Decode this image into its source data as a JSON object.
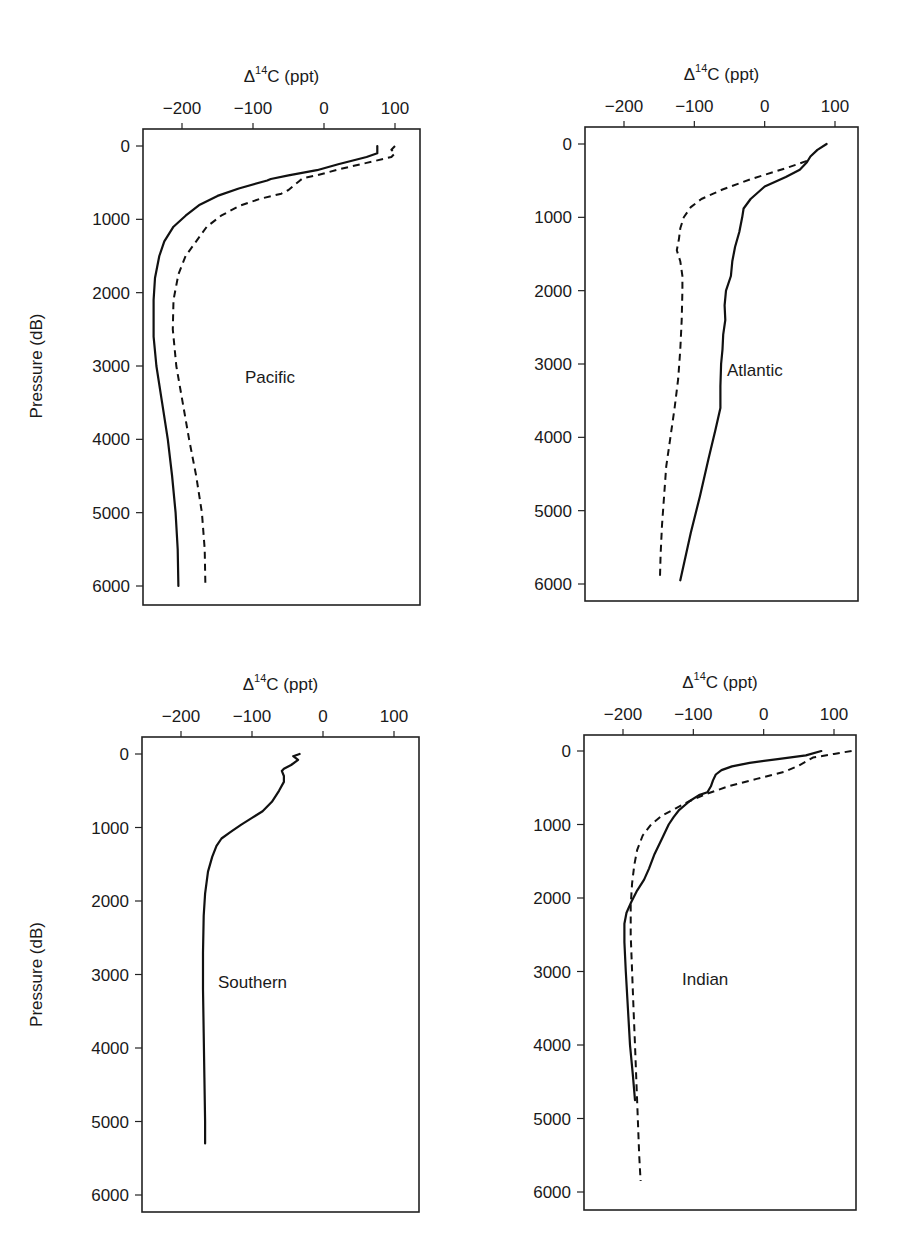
{
  "figure": {
    "xlabel": "Δ14C (ppt)",
    "xlabel_base": "Δ",
    "xlabel_sup": "14",
    "xlabel_rest": "C (ppt)",
    "ylabel": "Pressure (dB)"
  },
  "chart_data": [
    {
      "type": "line",
      "title": "Pacific",
      "xlabel": "Δ14C (ppt)",
      "ylabel": "Pressure (dB)",
      "xlim": [
        -255,
        135
      ],
      "ylim": [
        6200,
        -230
      ],
      "x_ticks": [
        -200,
        -100,
        0,
        100
      ],
      "y_ticks": [
        0,
        1000,
        2000,
        3000,
        4000,
        5000,
        6000
      ],
      "y_inverted": true,
      "grid": false,
      "series": [
        {
          "name": "solid",
          "style": "solid",
          "points": [
            [
              75,
              0
            ],
            [
              75,
              100
            ],
            [
              60,
              150
            ],
            [
              20,
              250
            ],
            [
              -10,
              330
            ],
            [
              -50,
              400
            ],
            [
              -75,
              450
            ],
            [
              -80,
              470
            ],
            [
              -120,
              580
            ],
            [
              -150,
              680
            ],
            [
              -175,
              800
            ],
            [
              -195,
              950
            ],
            [
              -212,
              1100
            ],
            [
              -225,
              1300
            ],
            [
              -232,
              1500
            ],
            [
              -238,
              1800
            ],
            [
              -240,
              2100
            ],
            [
              -240,
              2600
            ],
            [
              -236,
              3000
            ],
            [
              -228,
              3500
            ],
            [
              -220,
              4000
            ],
            [
              -214,
              4500
            ],
            [
              -209,
              5000
            ],
            [
              -206,
              5500
            ],
            [
              -205,
              6000
            ]
          ]
        },
        {
          "name": "dashed",
          "style": "dashed",
          "points": [
            [
              100,
              0
            ],
            [
              95,
              50
            ],
            [
              100,
              100
            ],
            [
              95,
              150
            ],
            [
              60,
              230
            ],
            [
              20,
              320
            ],
            [
              -10,
              400
            ],
            [
              -30,
              440
            ],
            [
              -35,
              480
            ],
            [
              -50,
              600
            ],
            [
              -60,
              650
            ],
            [
              -90,
              720
            ],
            [
              -120,
              820
            ],
            [
              -145,
              950
            ],
            [
              -165,
              1100
            ],
            [
              -180,
              1300
            ],
            [
              -195,
              1500
            ],
            [
              -205,
              1750
            ],
            [
              -212,
              2100
            ],
            [
              -213,
              2500
            ],
            [
              -208,
              3000
            ],
            [
              -199,
              3500
            ],
            [
              -190,
              4000
            ],
            [
              -180,
              4500
            ],
            [
              -172,
              5000
            ],
            [
              -168,
              5500
            ],
            [
              -167,
              6000
            ]
          ]
        }
      ]
    },
    {
      "type": "line",
      "title": "Atlantic",
      "xlabel": "Δ14C (ppt)",
      "ylabel": "Pressure (dB)",
      "xlim": [
        -255,
        130
      ],
      "ylim": [
        6200,
        -230
      ],
      "x_ticks": [
        -200,
        -100,
        0,
        100
      ],
      "y_ticks": [
        0,
        1000,
        2000,
        3000,
        4000,
        5000,
        6000
      ],
      "y_inverted": true,
      "grid": false,
      "series": [
        {
          "name": "solid",
          "style": "solid",
          "points": [
            [
              88,
              0
            ],
            [
              75,
              80
            ],
            [
              65,
              170
            ],
            [
              60,
              250
            ],
            [
              50,
              350
            ],
            [
              30,
              450
            ],
            [
              0,
              580
            ],
            [
              -20,
              750
            ],
            [
              -30,
              880
            ],
            [
              -32,
              1000
            ],
            [
              -36,
              1200
            ],
            [
              -42,
              1400
            ],
            [
              -46,
              1600
            ],
            [
              -48,
              1800
            ],
            [
              -55,
              2000
            ],
            [
              -57,
              2200
            ],
            [
              -56,
              2400
            ],
            [
              -59,
              2600
            ],
            [
              -60,
              2800
            ],
            [
              -62,
              3000
            ],
            [
              -63,
              3300
            ],
            [
              -63,
              3600
            ],
            [
              -70,
              3900
            ],
            [
              -80,
              4300
            ],
            [
              -92,
              4800
            ],
            [
              -105,
              5300
            ],
            [
              -120,
              5950
            ]
          ]
        },
        {
          "name": "dashed",
          "style": "dashed",
          "points": [
            [
              60,
              230
            ],
            [
              30,
              330
            ],
            [
              -20,
              480
            ],
            [
              -60,
              620
            ],
            [
              -90,
              750
            ],
            [
              -105,
              860
            ],
            [
              -115,
              1000
            ],
            [
              -120,
              1150
            ],
            [
              -122,
              1300
            ],
            [
              -125,
              1450
            ],
            [
              -120,
              1600
            ],
            [
              -117,
              1800
            ],
            [
              -117,
              2000
            ],
            [
              -118,
              2400
            ],
            [
              -120,
              2800
            ],
            [
              -123,
              3200
            ],
            [
              -128,
              3600
            ],
            [
              -134,
              4000
            ],
            [
              -140,
              4400
            ],
            [
              -143,
              4800
            ],
            [
              -146,
              5200
            ],
            [
              -148,
              5600
            ],
            [
              -149,
              5950
            ]
          ]
        }
      ]
    },
    {
      "type": "line",
      "title": "Southern",
      "xlabel": "Δ14C (ppt)",
      "ylabel": "Pressure (dB)",
      "xlim": [
        -255,
        135
      ],
      "ylim": [
        6200,
        -230
      ],
      "x_ticks": [
        -200,
        -100,
        0,
        100
      ],
      "y_ticks": [
        0,
        1000,
        2000,
        3000,
        4000,
        5000,
        6000
      ],
      "y_inverted": true,
      "grid": false,
      "series": [
        {
          "name": "solid",
          "style": "solid",
          "points": [
            [
              -33,
              0
            ],
            [
              -42,
              30
            ],
            [
              -35,
              80
            ],
            [
              -45,
              150
            ],
            [
              -55,
              200
            ],
            [
              -58,
              230
            ],
            [
              -55,
              300
            ],
            [
              -55,
              380
            ],
            [
              -62,
              500
            ],
            [
              -72,
              650
            ],
            [
              -85,
              780
            ],
            [
              -100,
              870
            ],
            [
              -115,
              960
            ],
            [
              -130,
              1060
            ],
            [
              -143,
              1150
            ],
            [
              -150,
              1250
            ],
            [
              -156,
              1400
            ],
            [
              -162,
              1600
            ],
            [
              -166,
              1900
            ],
            [
              -168,
              2200
            ],
            [
              -169,
              2700
            ],
            [
              -169,
              3200
            ],
            [
              -168,
              3800
            ],
            [
              -167,
              4400
            ],
            [
              -166,
              5000
            ],
            [
              -166,
              5300
            ]
          ]
        }
      ]
    },
    {
      "type": "line",
      "title": "Indian",
      "xlabel": "Δ14C (ppt)",
      "ylabel": "Pressure (dB)",
      "xlim": [
        -255,
        130
      ],
      "ylim": [
        6200,
        -230
      ],
      "x_ticks": [
        -200,
        -100,
        0,
        100
      ],
      "y_ticks": [
        0,
        1000,
        2000,
        3000,
        4000,
        5000,
        6000
      ],
      "y_inverted": true,
      "grid": false,
      "series": [
        {
          "name": "solid",
          "style": "solid",
          "points": [
            [
              82,
              0
            ],
            [
              60,
              60
            ],
            [
              20,
              110
            ],
            [
              -20,
              160
            ],
            [
              -45,
              210
            ],
            [
              -60,
              260
            ],
            [
              -68,
              320
            ],
            [
              -72,
              400
            ],
            [
              -75,
              480
            ],
            [
              -80,
              560
            ],
            [
              -92,
              600
            ],
            [
              -105,
              680
            ],
            [
              -120,
              800
            ],
            [
              -128,
              900
            ],
            [
              -135,
              1000
            ],
            [
              -145,
              1200
            ],
            [
              -155,
              1400
            ],
            [
              -163,
              1600
            ],
            [
              -170,
              1750
            ],
            [
              -180,
              1900
            ],
            [
              -188,
              2050
            ],
            [
              -195,
              2200
            ],
            [
              -198,
              2350
            ],
            [
              -198,
              2600
            ],
            [
              -196,
              3000
            ],
            [
              -193,
              3500
            ],
            [
              -190,
              4000
            ],
            [
              -186,
              4400
            ],
            [
              -183,
              4750
            ]
          ]
        },
        {
          "name": "dashed",
          "style": "dashed",
          "points": [
            [
              125,
              0
            ],
            [
              100,
              40
            ],
            [
              70,
              90
            ],
            [
              50,
              200
            ],
            [
              30,
              280
            ],
            [
              -10,
              380
            ],
            [
              -50,
              480
            ],
            [
              -80,
              580
            ],
            [
              -105,
              680
            ],
            [
              -125,
              780
            ],
            [
              -145,
              880
            ],
            [
              -160,
              1000
            ],
            [
              -172,
              1150
            ],
            [
              -180,
              1350
            ],
            [
              -184,
              1550
            ],
            [
              -187,
              1800
            ],
            [
              -189,
              2100
            ],
            [
              -189,
              2500
            ],
            [
              -187,
              3000
            ],
            [
              -185,
              3500
            ],
            [
              -183,
              4000
            ],
            [
              -181,
              4500
            ],
            [
              -179,
              5000
            ],
            [
              -177,
              5500
            ],
            [
              -175,
              5850
            ]
          ]
        }
      ]
    }
  ],
  "panels": [
    {
      "label": "Pacific",
      "box": [
        143,
        129,
        420,
        605
      ],
      "x_px": [
        182,
        395
      ],
      "y_px": [
        146,
        586
      ],
      "label_pos": [
        245,
        383
      ],
      "show_ylabel": true
    },
    {
      "label": "Atlantic",
      "box": [
        585,
        127,
        858,
        601
      ],
      "x_px": [
        624,
        835
      ],
      "y_px": [
        144,
        584
      ],
      "label_pos": [
        727,
        376
      ],
      "show_ylabel": false
    },
    {
      "label": "Southern",
      "box": [
        142,
        737,
        419,
        1212
      ],
      "x_px": [
        181,
        394
      ],
      "y_px": [
        754,
        1195
      ],
      "label_pos": [
        218,
        988
      ],
      "show_ylabel": true
    },
    {
      "label": "Indian",
      "box": [
        584,
        735,
        856,
        1210
      ],
      "x_px": [
        623,
        834
      ],
      "y_px": [
        751,
        1192
      ],
      "label_pos": [
        682,
        985
      ],
      "show_ylabel": false
    }
  ]
}
